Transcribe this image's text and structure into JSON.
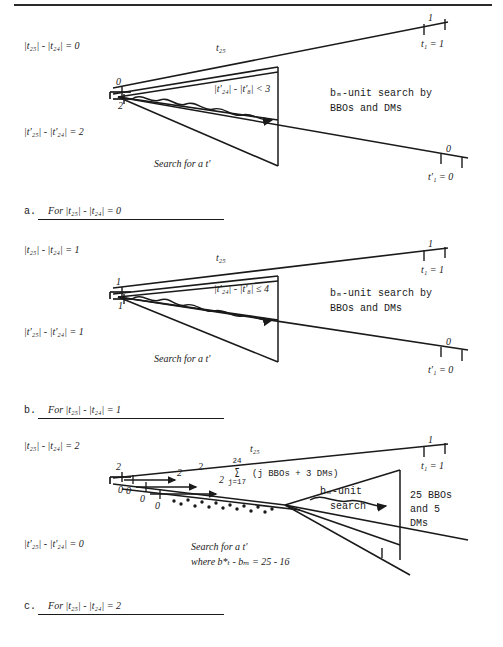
{
  "figure": {
    "top_rule": true,
    "ink_color": "#1a1a1a"
  },
  "panels": [
    {
      "id": "a",
      "caption_prefix": "a.",
      "caption_text": "For |t₂₅| - |t₂₄| = 0",
      "left_top_label": "|t₂₅| - |t₂₄| = 0",
      "left_bottom_label": "|t'₂₅| - |t'₂₄| = 2",
      "vertex_upper_tick": "0",
      "vertex_lower_tick": "2",
      "edge_label": "t₂₅",
      "wavy_label": "|t'₂₄| - |t'₈| < 3",
      "right_text_line1": "bₘ-unit search by",
      "right_text_line2": "BBOs and DMs",
      "bottom_text": "Search for a t'",
      "top_end_tick": "1",
      "top_end_label": "t₁ = 1",
      "bottom_end_tick": "0",
      "bottom_end_label": "t'₁ = 0"
    },
    {
      "id": "b",
      "caption_prefix": "b.",
      "caption_text": "For |t₂₅| - |t₂₄| = 1",
      "left_top_label": "|t₂₅| - |t₂₄| = 1",
      "left_bottom_label": "|t'₂₅| - |t'₂₄| = 1",
      "vertex_upper_tick": "1",
      "vertex_lower_tick": "1",
      "edge_label": "t₂₅",
      "wavy_label": "|t'₂₄| - |t'₈| ≤ 4",
      "right_text_line1": "bₘ-unit search by",
      "right_text_line2": "BBOs and DMs",
      "bottom_text": "Search for a t'",
      "top_end_tick": "1",
      "top_end_label": "t₁ = 1",
      "bottom_end_tick": "0",
      "bottom_end_label": "t'₁ = 0"
    },
    {
      "id": "c",
      "caption_prefix": "c.",
      "caption_text": "For |t₂₅| - |t₂₄| = 2",
      "left_top_label": "|t₂₅| - |t₂₄| = 2",
      "left_bottom_label": "|t'₂₅| - |t'₂₄| = 0",
      "vertex_upper_tick": "2",
      "vertex_lower_tick": "0",
      "edge_label": "t₂₅",
      "step_labels_upper": [
        "2",
        "2",
        "2"
      ],
      "step_labels_lower": [
        "0",
        "0",
        "0"
      ],
      "sum_upper_limit": "24",
      "sum_lower_limit": "j=17",
      "sum_term": "(j BBOs + 3 DMs)",
      "right_text_line1": "bₘ-unit",
      "right_text_line2": "search",
      "side_note_line1": "25 BBOs",
      "side_note_line2": "and 5",
      "side_note_line3": "DMs",
      "bottom_text_line1": "Search for a t'",
      "bottom_text_line2": "where b*ₜ - bₘ = 25 - 16",
      "top_end_tick": "1",
      "top_end_label": "t₁ = 1"
    }
  ]
}
